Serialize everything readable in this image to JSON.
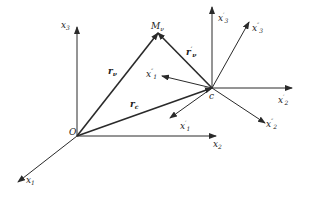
{
  "diagram": {
    "type": "coordinate-frames-vector-diagram",
    "points": {
      "origin": {
        "label": "O",
        "x": 77,
        "y": 136
      },
      "center": {
        "label": "c",
        "x": 212,
        "y": 88
      },
      "mass_point": {
        "label": "M",
        "sub": "ν",
        "x": 158,
        "y": 33
      }
    },
    "global_axes": [
      {
        "id": "x1",
        "base": "x",
        "sub": "1",
        "prime": "",
        "to": [
          18,
          182
        ]
      },
      {
        "id": "x2",
        "base": "x",
        "sub": "2",
        "prime": "",
        "to": [
          216,
          136
        ]
      },
      {
        "id": "x3",
        "base": "x",
        "sub": "3",
        "prime": "",
        "to": [
          77,
          27
        ]
      }
    ],
    "local_axes_prime": [
      {
        "id": "x1p",
        "base": "x",
        "sub": "1",
        "prime": "′",
        "to": [
          170,
          118
        ]
      },
      {
        "id": "x2p",
        "base": "x",
        "sub": "2",
        "prime": "′",
        "to": [
          292,
          88
        ]
      },
      {
        "id": "x3p",
        "base": "x",
        "sub": "3",
        "prime": "′",
        "to": [
          212,
          7
        ]
      }
    ],
    "local_axes_double_prime": [
      {
        "id": "x1pp",
        "base": "x",
        "sub": "1",
        "prime": "″",
        "to": [
          162,
          76
        ]
      },
      {
        "id": "x2pp",
        "base": "x",
        "sub": "2",
        "prime": "″",
        "to": [
          265,
          123
        ]
      },
      {
        "id": "x3pp",
        "base": "x",
        "sub": "3",
        "prime": "″",
        "to": [
          249,
          22
        ]
      }
    ],
    "vectors": [
      {
        "id": "r_nu",
        "base": "r",
        "sub": "ν",
        "prime": "",
        "from": "origin",
        "to": "mass_point"
      },
      {
        "id": "r_c",
        "base": "r",
        "sub": "c",
        "prime": "",
        "from": "origin",
        "to": "center"
      },
      {
        "id": "r_nu_prime",
        "base": "r",
        "sub": "ν",
        "prime": "′",
        "from": "center",
        "to": "mass_point"
      }
    ],
    "labels": {
      "O": "O",
      "c": "c",
      "M": "M",
      "M_sub": "ν",
      "x": "x",
      "r": "r",
      "s1": "1",
      "s2": "2",
      "s3": "3",
      "nu": "ν",
      "cc": "c",
      "p": "′",
      "pp": "″"
    },
    "colors": {
      "line": "#2a2a2a",
      "background": "#ffffff"
    }
  }
}
